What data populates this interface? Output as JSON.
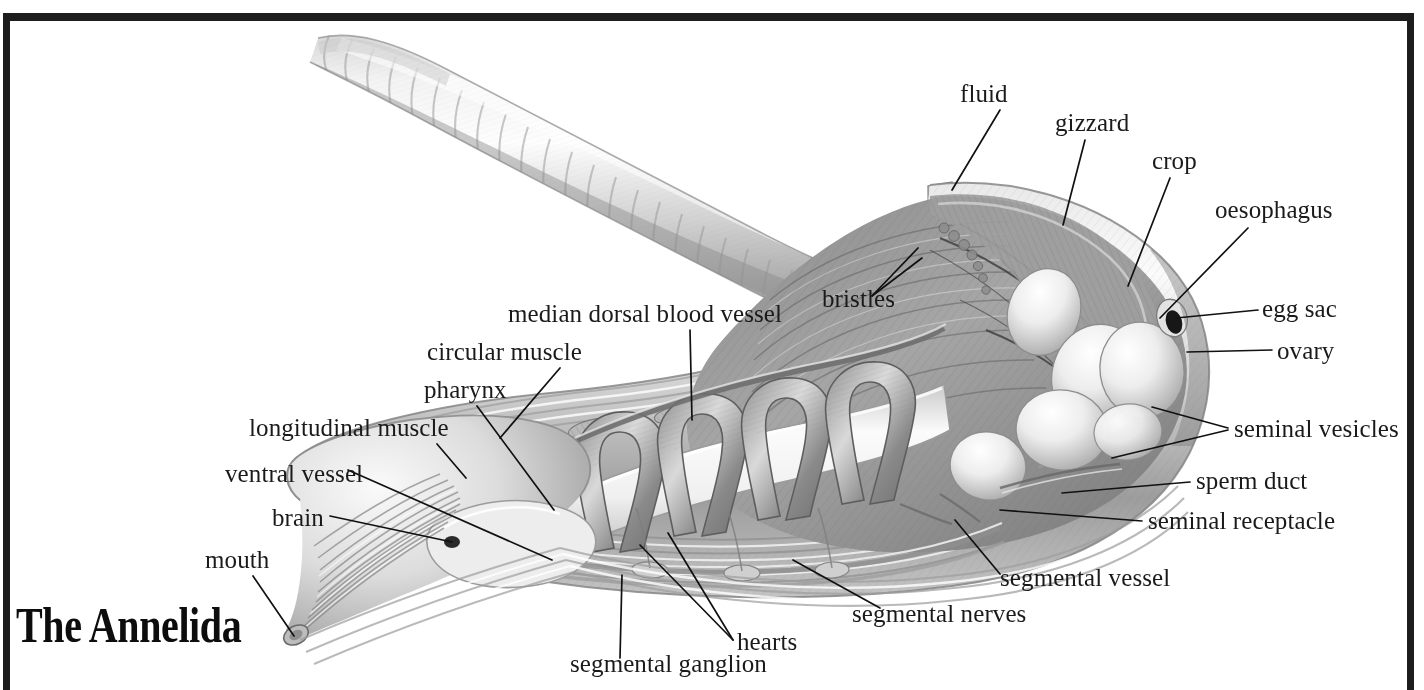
{
  "title": "The Annelida",
  "colors": {
    "frame": "#1d1d1d",
    "label_text": "#1a1a1a",
    "leader_line": "#111111",
    "background": "#ffffff",
    "body_light": "#f2f2f2",
    "body_mid": "#b8b8b8",
    "body_dark": "#6e6e6e",
    "organ_light": "#fafafa",
    "organ_shadow": "#9a9a9a"
  },
  "labels": [
    {
      "id": "fluid",
      "text": "fluid",
      "x": 960,
      "y": 100,
      "align": "left"
    },
    {
      "id": "gizzard",
      "text": "gizzard",
      "x": 1055,
      "y": 129,
      "align": "left"
    },
    {
      "id": "crop",
      "text": "crop",
      "x": 1152,
      "y": 167,
      "align": "left"
    },
    {
      "id": "oesophagus",
      "text": "oesophagus",
      "x": 1215,
      "y": 216,
      "align": "left"
    },
    {
      "id": "egg-sac",
      "text": "egg sac",
      "x": 1262,
      "y": 315,
      "align": "left"
    },
    {
      "id": "ovary",
      "text": "ovary",
      "x": 1277,
      "y": 357,
      "align": "left"
    },
    {
      "id": "seminal-vesicles",
      "text": "seminal vesicles",
      "x": 1234,
      "y": 435,
      "align": "left"
    },
    {
      "id": "sperm-duct",
      "text": "sperm duct",
      "x": 1196,
      "y": 487,
      "align": "left"
    },
    {
      "id": "seminal-receptacle",
      "text": "seminal receptacle",
      "x": 1148,
      "y": 527,
      "align": "left"
    },
    {
      "id": "segmental-vessel",
      "text": "segmental vessel",
      "x": 1000,
      "y": 584,
      "align": "left"
    },
    {
      "id": "segmental-nerves",
      "text": "segmental nerves",
      "x": 852,
      "y": 620,
      "align": "left"
    },
    {
      "id": "hearts",
      "text": "hearts",
      "x": 737,
      "y": 648,
      "align": "left"
    },
    {
      "id": "segmental-ganglion",
      "text": "segmental ganglion",
      "x": 570,
      "y": 670,
      "align": "left"
    },
    {
      "id": "bristles",
      "text": "bristles",
      "x": 822,
      "y": 305,
      "align": "left"
    },
    {
      "id": "median-dorsal-blood-vessel",
      "text": "median dorsal blood vessel",
      "x": 508,
      "y": 320,
      "align": "left"
    },
    {
      "id": "circular-muscle",
      "text": "circular muscle",
      "x": 427,
      "y": 358,
      "align": "left"
    },
    {
      "id": "pharynx",
      "text": "pharynx",
      "x": 424,
      "y": 396,
      "align": "left"
    },
    {
      "id": "longitudinal-muscle",
      "text": "longitudinal muscle",
      "x": 249,
      "y": 434,
      "align": "left"
    },
    {
      "id": "ventral-vessel",
      "text": "ventral vessel",
      "x": 225,
      "y": 480,
      "align": "left"
    },
    {
      "id": "brain",
      "text": "brain",
      "x": 272,
      "y": 524,
      "align": "left"
    },
    {
      "id": "mouth",
      "text": "mouth",
      "x": 205,
      "y": 566,
      "align": "left"
    }
  ],
  "leaders": [
    {
      "id": "fluid-leader",
      "points": "1000,110 952,190"
    },
    {
      "id": "gizzard-leader",
      "points": "1085,140 1063,225"
    },
    {
      "id": "crop-leader",
      "points": "1170,178 1128,286"
    },
    {
      "id": "oesophagus-leader",
      "points": "1248,228 1160,318"
    },
    {
      "id": "egg-sac-leader",
      "points": "1258,310 1176,318"
    },
    {
      "id": "ovary-leader",
      "points": "1272,350 1187,352"
    },
    {
      "id": "seminal-vesicles-leader-a",
      "points": "1228,428 1152,407"
    },
    {
      "id": "seminal-vesicles-leader-b",
      "points": "1228,430 1112,458"
    },
    {
      "id": "sperm-duct-leader",
      "points": "1190,482 1062,493"
    },
    {
      "id": "seminal-receptacle-leader",
      "points": "1142,521 1000,510"
    },
    {
      "id": "segmental-vessel-leader",
      "points": "1000,574 955,520"
    },
    {
      "id": "segmental-nerves-leader",
      "points": "880,608 793,560"
    },
    {
      "id": "hearts-leader-a",
      "points": "733,640 640,545"
    },
    {
      "id": "hearts-leader-b",
      "points": "733,640 668,533"
    },
    {
      "id": "segmental-ganglion-leader",
      "points": "620,658 622,575"
    },
    {
      "id": "bristles-leader-a",
      "points": "872,296 918,248"
    },
    {
      "id": "bristles-leader-b",
      "points": "872,296 922,258"
    },
    {
      "id": "median-dorsal-blood-vessel-leader",
      "points": "690,330 692,420"
    },
    {
      "id": "circular-muscle-leader",
      "points": "560,368 500,438"
    },
    {
      "id": "pharynx-leader",
      "points": "477,406 554,510"
    },
    {
      "id": "longitudinal-muscle-leader",
      "points": "437,444 466,478"
    },
    {
      "id": "ventral-vessel-leader",
      "points": "348,470 552,560"
    },
    {
      "id": "brain-leader",
      "points": "330,516 452,542"
    },
    {
      "id": "mouth-leader",
      "points": "253,576 294,636"
    }
  ]
}
